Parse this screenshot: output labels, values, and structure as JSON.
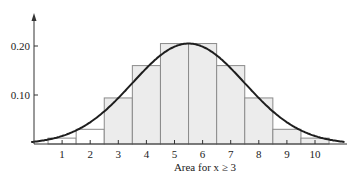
{
  "chart_data": {
    "type": "bar",
    "title": "",
    "xlabel": "Area for x ≥ 3",
    "ylabel": "",
    "categories": [
      "1",
      "2",
      "3",
      "4",
      "5",
      "6",
      "7",
      "8",
      "9",
      "10"
    ],
    "values": [
      0.012,
      0.03,
      0.094,
      0.16,
      0.205,
      0.205,
      0.16,
      0.094,
      0.03,
      0.012
    ],
    "shaded_from": 3,
    "y_ticks": [
      {
        "value": 0.1,
        "label": "0.10"
      },
      {
        "value": 0.2,
        "label": "0.20"
      }
    ],
    "ylim": [
      0,
      0.26
    ],
    "xlim": [
      0,
      11.5
    ],
    "overlay": {
      "type": "normal-curve",
      "mean": 5.5,
      "peak": 0.205,
      "sd": 2.0
    },
    "grid": false,
    "legend": null
  },
  "colors": {
    "shaded_fill": "#ececec",
    "unshaded_fill": "#ffffff",
    "bar_stroke": "#8a8a8a",
    "curve": "#1e1e1e",
    "axis": "#333333"
  }
}
